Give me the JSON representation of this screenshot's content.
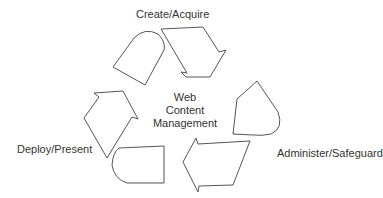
{
  "diagram": {
    "title": "Web Content Management",
    "center_lines": [
      "Web",
      "Content",
      "Management"
    ],
    "stages": [
      {
        "label": "Create/Acquire"
      },
      {
        "label": "Administer/Safeguard"
      },
      {
        "label": "Deploy/Present"
      }
    ],
    "stroke_color": "#555555",
    "text_color": "#333333"
  }
}
